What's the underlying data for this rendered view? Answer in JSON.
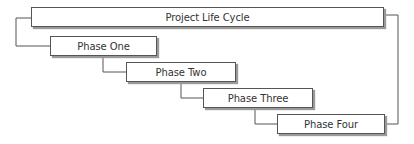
{
  "diagram": {
    "title": "Project Life Cycle",
    "phases": [
      {
        "label": "Phase One"
      },
      {
        "label": "Phase Two"
      },
      {
        "label": "Phase Three"
      },
      {
        "label": "Phase Four"
      }
    ],
    "colors": {
      "box_fill": "#ffffff",
      "box_border": "#555555",
      "shadow": "#9a9a9a",
      "connector": "#555555",
      "text": "#333333"
    }
  }
}
